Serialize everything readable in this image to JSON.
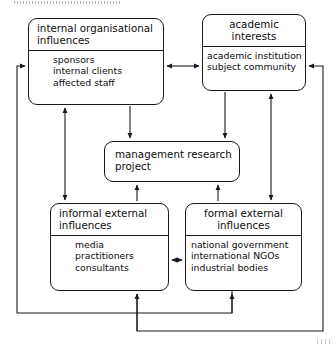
{
  "diagram": {
    "type": "influence-diagram",
    "nodes": [
      {
        "id": "internal-org",
        "title": [
          "internal organisational",
          "influences"
        ],
        "items": [
          "sponsors",
          "internal clients",
          "affected staff"
        ]
      },
      {
        "id": "academic",
        "title": [
          "academic",
          "interests"
        ],
        "items": [
          "academic institution",
          "subject community"
        ]
      },
      {
        "id": "center",
        "title": [
          "management research",
          "project"
        ],
        "items": []
      },
      {
        "id": "informal",
        "title": [
          "informal external",
          "influences"
        ],
        "items": [
          "media",
          "practitioners",
          "consultants"
        ]
      },
      {
        "id": "formal",
        "title": [
          "formal external",
          "influences"
        ],
        "items": [
          "national government",
          "international NGOs",
          "industrial bodies"
        ]
      }
    ],
    "connections": [
      {
        "id": "internal-academic",
        "from": "internal-org",
        "to": "academic",
        "style": "double-headed-horizontal"
      },
      {
        "id": "internal-informal",
        "from": "internal-org",
        "to": "informal",
        "style": "double-headed-vertical"
      },
      {
        "id": "academic-formal",
        "from": "academic",
        "to": "formal",
        "style": "double-headed-vertical"
      },
      {
        "id": "informal-formal",
        "from": "informal",
        "to": "formal",
        "style": "double-headed-horizontal"
      },
      {
        "id": "internal-center",
        "from": "internal-org",
        "to": "center",
        "style": "arrow-down"
      },
      {
        "id": "academic-center",
        "from": "academic",
        "to": "center",
        "style": "arrow-down"
      },
      {
        "id": "informal-center",
        "from": "informal",
        "to": "center",
        "style": "arrow-up"
      },
      {
        "id": "formal-center",
        "from": "formal",
        "to": "center",
        "style": "arrow-up"
      },
      {
        "id": "feedback-left-loop",
        "from": "informal",
        "to": "internal-org",
        "style": "elbow-feedback"
      },
      {
        "id": "feedback-right-loop",
        "from": "formal",
        "to": "academic",
        "style": "elbow-feedback"
      }
    ],
    "colors": {
      "stroke": "#1a1a1a",
      "text": "#0d0d0d",
      "background": "#ffffff"
    }
  }
}
